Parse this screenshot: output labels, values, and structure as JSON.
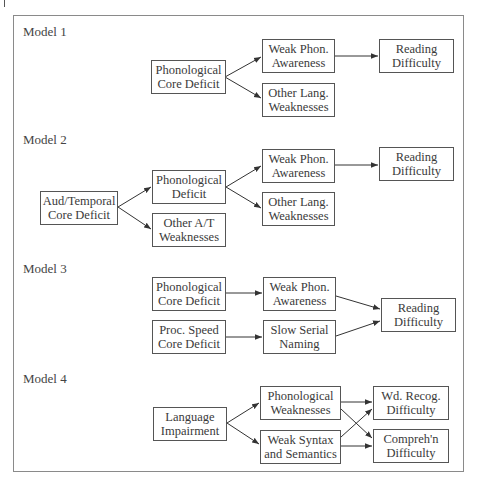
{
  "diagram": {
    "models": [
      {
        "label": "Model 1",
        "boxes": [
          {
            "id": "m1_core",
            "line1": "Phonological",
            "line2": "Core Deficit"
          },
          {
            "id": "m1_wpa",
            "line1": "Weak Phon.",
            "line2": "Awareness"
          },
          {
            "id": "m1_olw",
            "line1": "Other Lang.",
            "line2": "Weaknesses"
          },
          {
            "id": "m1_rd",
            "line1": "Reading",
            "line2": "Difficulty"
          }
        ],
        "edges": [
          [
            "m1_core",
            "m1_wpa"
          ],
          [
            "m1_core",
            "m1_olw"
          ],
          [
            "m1_wpa",
            "m1_rd"
          ]
        ]
      },
      {
        "label": "Model 2",
        "boxes": [
          {
            "id": "m2_aud",
            "line1": "Aud/Temporal",
            "line2": "Core Deficit"
          },
          {
            "id": "m2_pd",
            "line1": "Phonological",
            "line2": "Deficit"
          },
          {
            "id": "m2_oat",
            "line1": "Other A/T",
            "line2": "Weaknesses"
          },
          {
            "id": "m2_wpa",
            "line1": "Weak Phon.",
            "line2": "Awareness"
          },
          {
            "id": "m2_olw",
            "line1": "Other Lang.",
            "line2": "Weaknesses"
          },
          {
            "id": "m2_rd",
            "line1": "Reading",
            "line2": "Difficulty"
          }
        ],
        "edges": [
          [
            "m2_aud",
            "m2_pd"
          ],
          [
            "m2_aud",
            "m2_oat"
          ],
          [
            "m2_pd",
            "m2_wpa"
          ],
          [
            "m2_pd",
            "m2_olw"
          ],
          [
            "m2_wpa",
            "m2_rd"
          ]
        ]
      },
      {
        "label": "Model 3",
        "boxes": [
          {
            "id": "m3_pcd",
            "line1": "Phonological",
            "line2": "Core Deficit"
          },
          {
            "id": "m3_wpa",
            "line1": "Weak Phon.",
            "line2": "Awareness"
          },
          {
            "id": "m3_psc",
            "line1": "Proc. Speed",
            "line2": "Core Deficit"
          },
          {
            "id": "m3_ssn",
            "line1": "Slow Serial",
            "line2": "Naming"
          },
          {
            "id": "m3_rd",
            "line1": "Reading",
            "line2": "Difficulty"
          }
        ],
        "edges": [
          [
            "m3_pcd",
            "m3_wpa"
          ],
          [
            "m3_psc",
            "m3_ssn"
          ],
          [
            "m3_wpa",
            "m3_rd"
          ],
          [
            "m3_ssn",
            "m3_rd"
          ]
        ]
      },
      {
        "label": "Model 4",
        "boxes": [
          {
            "id": "m4_li",
            "line1": "Language",
            "line2": "Impairment"
          },
          {
            "id": "m4_pw",
            "line1": "Phonological",
            "line2": "Weaknesses"
          },
          {
            "id": "m4_wss",
            "line1": "Weak Syntax",
            "line2": "and Semantics"
          },
          {
            "id": "m4_wrd",
            "line1": "Wd. Recog.",
            "line2": "Difficulty"
          },
          {
            "id": "m4_cd",
            "line1": "Compreh'n",
            "line2": "Difficulty"
          }
        ],
        "edges": [
          [
            "m4_li",
            "m4_pw"
          ],
          [
            "m4_li",
            "m4_wss"
          ],
          [
            "m4_pw",
            "m4_wrd"
          ],
          [
            "m4_pw",
            "m4_cd"
          ],
          [
            "m4_wss",
            "m4_wrd"
          ],
          [
            "m4_wss",
            "m4_cd"
          ]
        ]
      }
    ]
  }
}
